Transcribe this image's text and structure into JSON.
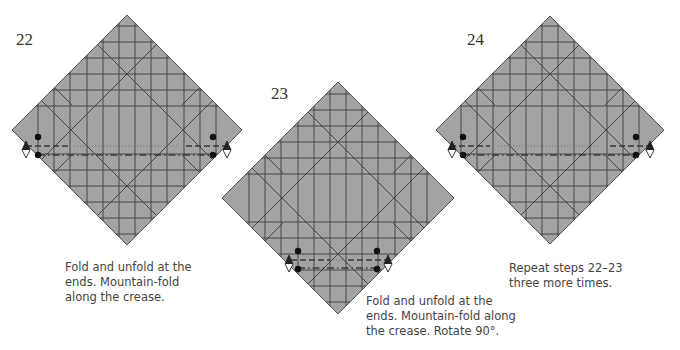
{
  "colors": {
    "paper": "#a3a3a3",
    "crease": "#3c3c3c",
    "edge": "#555555",
    "text": "#444444"
  },
  "steps": [
    {
      "number": "22",
      "caption": "Fold and unfold at the\nends. Mountain-fold\nalong the crease.",
      "diamond": {
        "cx": 127,
        "cy": 130,
        "r": 115
      },
      "fold_side": "horizontal-lower"
    },
    {
      "number": "23",
      "caption": "Fold and unfold at the\nends. Mountain-fold along\nthe crease. Rotate 90°.",
      "diamond": {
        "cx": 338,
        "cy": 198,
        "r": 116
      },
      "fold_side": "bottom"
    },
    {
      "number": "24",
      "caption": "Repeat steps 22–23\nthree more times.",
      "diamond": {
        "cx": 550,
        "cy": 130,
        "r": 114
      },
      "fold_side": "horizontal-lower"
    }
  ]
}
